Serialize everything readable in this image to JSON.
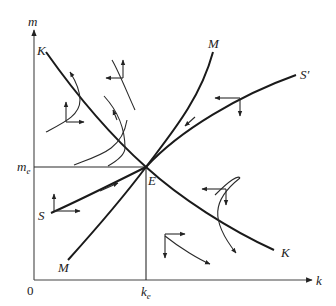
{
  "diagram": {
    "type": "phase-diagram",
    "axes": {
      "x_label": "k",
      "y_label": "m",
      "origin_label": "0",
      "x_equilibrium_label": "k",
      "x_equilibrium_subscript": "e",
      "y_equilibrium_label": "m",
      "y_equilibrium_subscript": "e"
    },
    "equilibrium_label": "E",
    "curves": [
      {
        "id": "K",
        "label_start": "K",
        "label_end": "K",
        "description": "downward sloping locus"
      },
      {
        "id": "M",
        "label_start": "M",
        "label_end": "M",
        "description": "upward sloping locus"
      },
      {
        "id": "S",
        "label_start": "S",
        "label_end": "S′",
        "description": "saddle path converging to E"
      }
    ]
  }
}
